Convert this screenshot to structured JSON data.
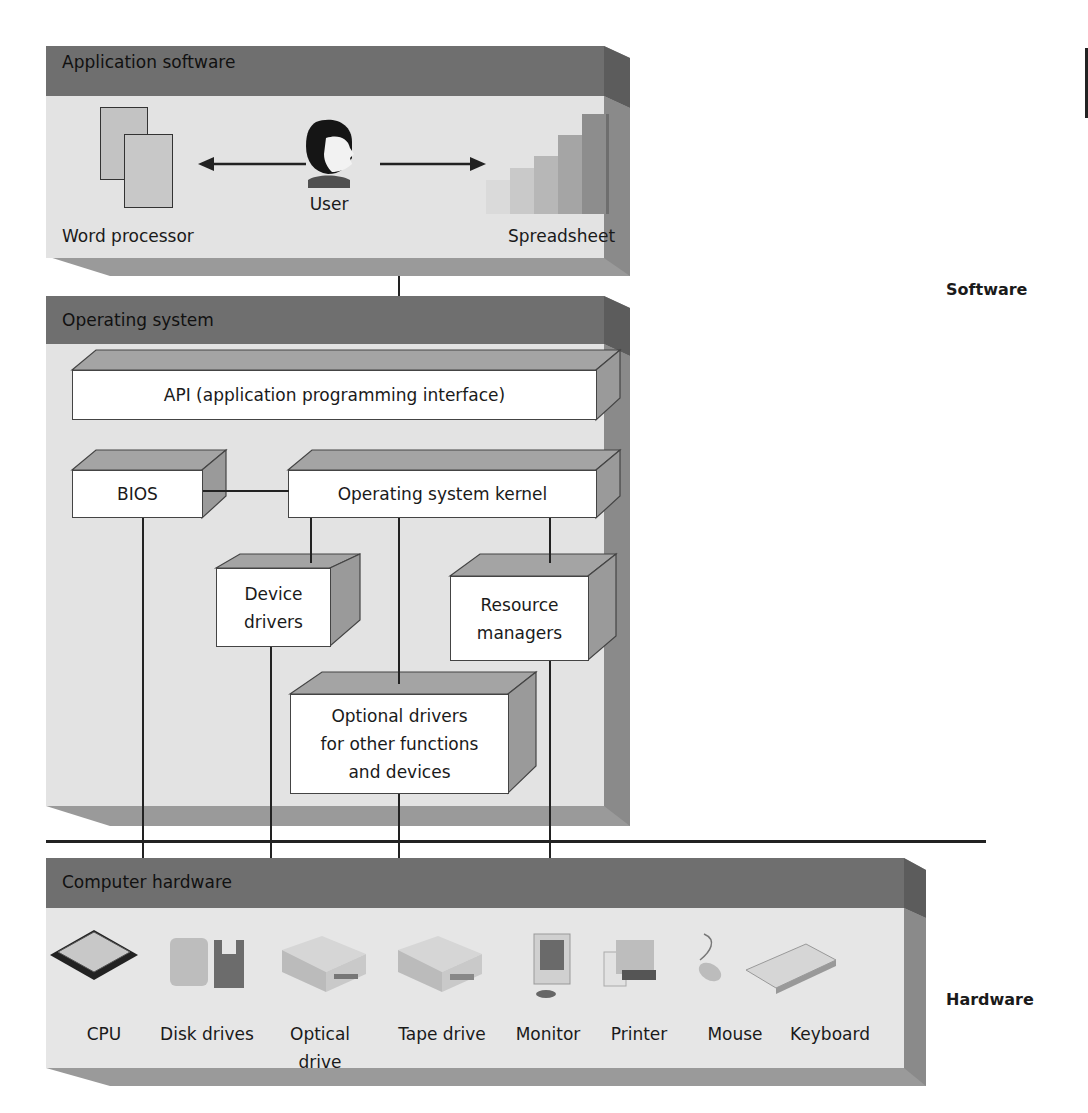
{
  "layers": {
    "application": {
      "title": "Application software"
    },
    "os": {
      "title": "Operating system"
    },
    "hardware": {
      "title": "Computer hardware"
    }
  },
  "application": {
    "word_processor": "Word processor",
    "user": "User",
    "spreadsheet": "Spreadsheet"
  },
  "os_components": {
    "api": "API (application programming interface)",
    "bios": "BIOS",
    "kernel": "Operating system kernel",
    "device_drivers": [
      "Device",
      "drivers"
    ],
    "resource_managers": [
      "Resource",
      "managers"
    ],
    "optional_drivers": [
      "Optional drivers",
      "for other functions",
      "and devices"
    ]
  },
  "hardware_items": [
    {
      "label": "CPU",
      "icon": "cpu-icon"
    },
    {
      "label": "Disk drives",
      "icon": "disk-drives-icon"
    },
    {
      "label": "Optical drive",
      "icon": "optical-drive-icon"
    },
    {
      "label": "Tape drive",
      "icon": "tape-drive-icon"
    },
    {
      "label": "Monitor",
      "icon": "monitor-icon"
    },
    {
      "label": "Printer",
      "icon": "printer-icon"
    },
    {
      "label": "Mouse",
      "icon": "mouse-icon"
    },
    {
      "label": "Keyboard",
      "icon": "keyboard-icon"
    }
  ],
  "side_labels": {
    "software": "Software",
    "hardware": "Hardware"
  },
  "colors": {
    "header": "#6f6f6f",
    "body": "#e2e2e2",
    "side": "#8c8c8c",
    "line": "#222222"
  }
}
